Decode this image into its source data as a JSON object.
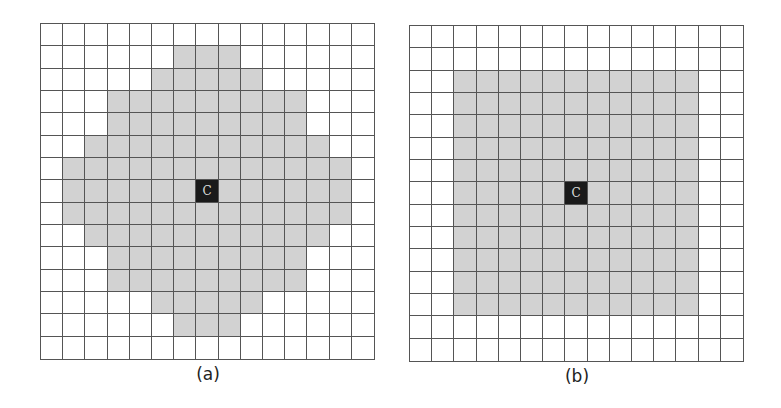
{
  "figure": {
    "grid_size": 15,
    "center": {
      "row": 7,
      "col": 7,
      "label": "C"
    },
    "colors": {
      "fill": "#d2d2d2",
      "empty": "#ffffff",
      "center": "#1a1a1a",
      "grid_line": "#555555"
    },
    "panels": [
      {
        "id": "a",
        "caption": "(a)",
        "shape": "diamond-like (circular) neighborhood",
        "filled_ranges_by_row": [
          null,
          [
            6,
            8
          ],
          [
            5,
            9
          ],
          [
            3,
            11
          ],
          [
            3,
            11
          ],
          [
            2,
            12
          ],
          [
            1,
            13
          ],
          [
            1,
            13
          ],
          [
            1,
            13
          ],
          [
            2,
            12
          ],
          [
            3,
            11
          ],
          [
            3,
            11
          ],
          [
            5,
            9
          ],
          [
            6,
            8
          ],
          null
        ]
      },
      {
        "id": "b",
        "caption": "(b)",
        "shape": "square neighborhood",
        "filled_ranges_by_row": [
          null,
          null,
          [
            2,
            12
          ],
          [
            2,
            12
          ],
          [
            2,
            12
          ],
          [
            2,
            12
          ],
          [
            2,
            12
          ],
          [
            2,
            12
          ],
          [
            2,
            12
          ],
          [
            2,
            12
          ],
          [
            2,
            12
          ],
          [
            2,
            12
          ],
          [
            2,
            12
          ],
          null,
          null
        ]
      }
    ]
  }
}
